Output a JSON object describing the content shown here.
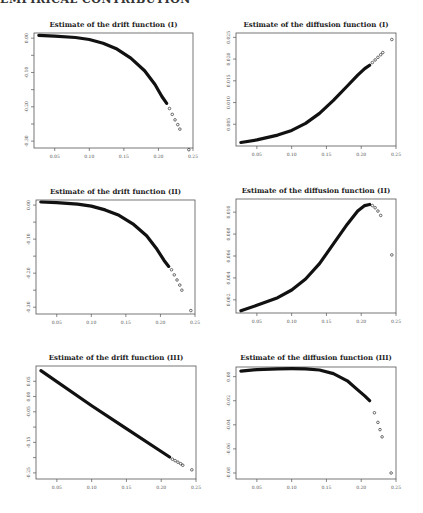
{
  "header": {
    "text": "EMPIRICAL CONTRIBUTION"
  },
  "chart_data": [
    {
      "id": "drift1",
      "type": "scatter",
      "title": "Estimate of the drift function (I)",
      "xlabel": "",
      "ylabel": "",
      "xlim": [
        0.02,
        0.25
      ],
      "ylim": [
        -0.32,
        0.015
      ],
      "xticks": [
        0.05,
        0.1,
        0.15,
        0.2,
        0.25
      ],
      "xtick_labels": [
        "0.05",
        "0.10",
        "0.15",
        "0.20",
        "0.25"
      ],
      "yticks": [
        0.0,
        -0.05,
        -0.1,
        -0.15,
        -0.2,
        -0.25,
        -0.3
      ],
      "ytick_labels": [
        "0.00",
        "",
        "-0.10",
        "",
        "-0.20",
        "",
        "-0.30"
      ],
      "curve": [
        [
          0.027,
          0.008
        ],
        [
          0.05,
          0.006
        ],
        [
          0.08,
          0.002
        ],
        [
          0.1,
          -0.004
        ],
        [
          0.12,
          -0.015
        ],
        [
          0.14,
          -0.032
        ],
        [
          0.16,
          -0.058
        ],
        [
          0.18,
          -0.095
        ],
        [
          0.195,
          -0.135
        ],
        [
          0.205,
          -0.17
        ],
        [
          0.212,
          -0.19
        ]
      ],
      "outliers": [
        [
          0.216,
          -0.205
        ],
        [
          0.22,
          -0.222
        ],
        [
          0.224,
          -0.238
        ],
        [
          0.228,
          -0.252
        ],
        [
          0.231,
          -0.265
        ],
        [
          0.244,
          -0.325
        ]
      ],
      "grid": false,
      "legend": null
    },
    {
      "id": "diffusion1",
      "type": "scatter",
      "title": "Estimate of the diffusion function (I)",
      "xlabel": "",
      "ylabel": "",
      "xlim": [
        0.02,
        0.25
      ],
      "ylim": [
        0.0,
        0.026
      ],
      "xticks": [
        0.05,
        0.1,
        0.15,
        0.2,
        0.25
      ],
      "xtick_labels": [
        "0.05",
        "0.10",
        "0.15",
        "0.20",
        "0.25"
      ],
      "yticks": [
        0.005,
        0.01,
        0.015,
        0.02,
        0.025
      ],
      "ytick_labels": [
        "0.005",
        "0.010",
        "0.015",
        "0.020",
        "0.025"
      ],
      "curve": [
        [
          0.027,
          0.0008
        ],
        [
          0.05,
          0.0014
        ],
        [
          0.08,
          0.0025
        ],
        [
          0.1,
          0.0036
        ],
        [
          0.12,
          0.0052
        ],
        [
          0.14,
          0.0075
        ],
        [
          0.16,
          0.0105
        ],
        [
          0.18,
          0.0138
        ],
        [
          0.195,
          0.0163
        ],
        [
          0.205,
          0.0178
        ],
        [
          0.212,
          0.0186
        ]
      ],
      "outliers": [
        [
          0.216,
          0.0192
        ],
        [
          0.22,
          0.0198
        ],
        [
          0.224,
          0.0204
        ],
        [
          0.228,
          0.021
        ],
        [
          0.231,
          0.0215
        ],
        [
          0.244,
          0.0245
        ]
      ],
      "grid": false,
      "legend": null
    },
    {
      "id": "drift2",
      "type": "scatter",
      "title": "Estimate of the drift function (II)",
      "xlabel": "",
      "ylabel": "",
      "xlim": [
        0.02,
        0.25
      ],
      "ylim": [
        -0.32,
        0.015
      ],
      "xticks": [
        0.05,
        0.1,
        0.15,
        0.2,
        0.25
      ],
      "xtick_labels": [
        "0.05",
        "0.10",
        "0.15",
        "0.20",
        "0.25"
      ],
      "yticks": [
        0.0,
        -0.05,
        -0.1,
        -0.15,
        -0.2,
        -0.25,
        -0.3
      ],
      "ytick_labels": [
        "0.00",
        "",
        "-0.10",
        "",
        "-0.20",
        "",
        "-0.30"
      ],
      "curve": [
        [
          0.027,
          0.009
        ],
        [
          0.05,
          0.007
        ],
        [
          0.08,
          0.003
        ],
        [
          0.1,
          -0.003
        ],
        [
          0.12,
          -0.014
        ],
        [
          0.14,
          -0.03
        ],
        [
          0.16,
          -0.055
        ],
        [
          0.18,
          -0.09
        ],
        [
          0.195,
          -0.13
        ],
        [
          0.205,
          -0.162
        ],
        [
          0.212,
          -0.18
        ]
      ],
      "outliers": [
        [
          0.216,
          -0.19
        ],
        [
          0.22,
          -0.205
        ],
        [
          0.224,
          -0.22
        ],
        [
          0.228,
          -0.235
        ],
        [
          0.231,
          -0.25
        ],
        [
          0.244,
          -0.31
        ]
      ],
      "grid": false,
      "legend": null
    },
    {
      "id": "diffusion2",
      "type": "scatter",
      "title": "Estimate of the diffusion function (II)",
      "xlabel": "",
      "ylabel": "",
      "xlim": [
        0.02,
        0.25
      ],
      "ylim": [
        0.0008,
        0.0112
      ],
      "xticks": [
        0.05,
        0.1,
        0.15,
        0.2,
        0.25
      ],
      "xtick_labels": [
        "0.05",
        "0.10",
        "0.15",
        "0.20",
        "0.25"
      ],
      "yticks": [
        0.002,
        0.004,
        0.006,
        0.008,
        0.01
      ],
      "ytick_labels": [
        "0.002",
        "0.004",
        "0.006",
        "0.008",
        "0.010"
      ],
      "curve": [
        [
          0.027,
          0.001
        ],
        [
          0.05,
          0.0015
        ],
        [
          0.08,
          0.0022
        ],
        [
          0.1,
          0.0029
        ],
        [
          0.12,
          0.0039
        ],
        [
          0.14,
          0.0053
        ],
        [
          0.16,
          0.0071
        ],
        [
          0.18,
          0.0089
        ],
        [
          0.195,
          0.0101
        ],
        [
          0.205,
          0.0106
        ],
        [
          0.212,
          0.0107
        ]
      ],
      "outliers": [
        [
          0.216,
          0.0106
        ],
        [
          0.22,
          0.0104
        ],
        [
          0.224,
          0.0101
        ],
        [
          0.228,
          0.0097
        ],
        [
          0.244,
          0.0061
        ]
      ],
      "grid": false,
      "legend": null
    },
    {
      "id": "drift3",
      "type": "scatter",
      "title": "Estimate of the drift function (III)",
      "xlabel": "",
      "ylabel": "",
      "xlim": [
        0.02,
        0.25
      ],
      "ylim": [
        -0.27,
        0.1
      ],
      "xticks": [
        0.05,
        0.1,
        0.15,
        0.2,
        0.25
      ],
      "xtick_labels": [
        "0.05",
        "0.10",
        "0.15",
        "0.20",
        "0.25"
      ],
      "yticks": [
        0.05,
        0.0,
        -0.05,
        -0.1,
        -0.15,
        -0.2,
        -0.25
      ],
      "ytick_labels": [
        "0.05",
        "0.00",
        "-0.05",
        "",
        "-0.15",
        "",
        "-0.25"
      ],
      "curve": [
        [
          0.027,
          0.085
        ],
        [
          0.1,
          -0.03
        ],
        [
          0.15,
          -0.105
        ],
        [
          0.2,
          -0.18
        ],
        [
          0.212,
          -0.198
        ]
      ],
      "outliers": [
        [
          0.216,
          -0.205
        ],
        [
          0.22,
          -0.21
        ],
        [
          0.224,
          -0.215
        ],
        [
          0.228,
          -0.22
        ],
        [
          0.231,
          -0.225
        ],
        [
          0.244,
          -0.24
        ]
      ],
      "grid": false,
      "legend": null
    },
    {
      "id": "diffusion3",
      "type": "scatter",
      "title": "Estimate of the diffusion function (III)",
      "xlabel": "",
      "ylabel": "",
      "xlim": [
        0.02,
        0.25
      ],
      "ylim": [
        -0.085,
        0.008
      ],
      "xticks": [
        0.05,
        0.1,
        0.15,
        0.2,
        0.25
      ],
      "xtick_labels": [
        "0.05",
        "0.10",
        "0.15",
        "0.20",
        "0.25"
      ],
      "yticks": [
        0.0,
        -0.02,
        -0.04,
        -0.06,
        -0.08
      ],
      "ytick_labels": [
        "0.00",
        "-0.02",
        "-0.04",
        "-0.06",
        "-0.08"
      ],
      "curve": [
        [
          0.027,
          0.0045
        ],
        [
          0.05,
          0.0058
        ],
        [
          0.08,
          0.0065
        ],
        [
          0.1,
          0.0066
        ],
        [
          0.12,
          0.0064
        ],
        [
          0.14,
          0.0055
        ],
        [
          0.16,
          0.0025
        ],
        [
          0.18,
          -0.0035
        ],
        [
          0.195,
          -0.011
        ],
        [
          0.205,
          -0.016
        ],
        [
          0.212,
          -0.02
        ]
      ],
      "outliers": [
        [
          0.219,
          -0.03
        ],
        [
          0.224,
          -0.038
        ],
        [
          0.227,
          -0.044
        ],
        [
          0.23,
          -0.05
        ],
        [
          0.243,
          -0.08
        ]
      ],
      "grid": false,
      "legend": null
    }
  ]
}
